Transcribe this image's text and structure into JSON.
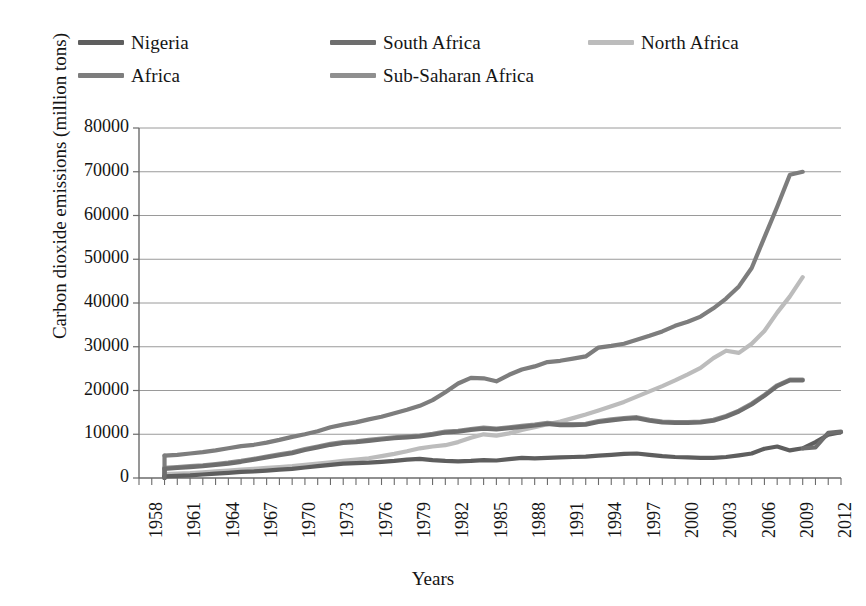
{
  "chart_data": {
    "type": "line",
    "title": "",
    "xlabel": "Years",
    "ylabel": "Carbon dioxide emissions (million tons)",
    "xlim": [
      1958,
      2013
    ],
    "ylim": [
      0,
      80000
    ],
    "ytick_step": 10000,
    "xtick_step": 3,
    "grid": true,
    "legend_position": "top",
    "ytick_labels": [
      "80000",
      "70000",
      "60000",
      "50000",
      "40000",
      "30000",
      "20000",
      "10000",
      "0"
    ],
    "ytick_values": [
      80000,
      70000,
      60000,
      50000,
      40000,
      30000,
      20000,
      10000,
      0
    ],
    "xtick_labels": [
      "1958",
      "1961",
      "1964",
      "1967",
      "1970",
      "1973",
      "1976",
      "1979",
      "1982",
      "1985",
      "1988",
      "1991",
      "1994",
      "1997",
      "2000",
      "2003",
      "2006",
      "2009",
      "2012"
    ],
    "xtick_values": [
      1958,
      1961,
      1964,
      1967,
      1970,
      1973,
      1976,
      1979,
      1982,
      1985,
      1988,
      1991,
      1994,
      1997,
      2000,
      2003,
      2006,
      2009,
      2012
    ],
    "x": [
      1960,
      1961,
      1962,
      1963,
      1964,
      1965,
      1966,
      1967,
      1968,
      1969,
      1970,
      1971,
      1972,
      1973,
      1974,
      1975,
      1976,
      1977,
      1978,
      1979,
      1980,
      1981,
      1982,
      1983,
      1984,
      1985,
      1986,
      1987,
      1988,
      1989,
      1990,
      1991,
      1992,
      1993,
      1994,
      1995,
      1996,
      1997,
      1998,
      1999,
      2000,
      2001,
      2002,
      2003,
      2004,
      2005,
      2006,
      2007,
      2008,
      2009,
      2010,
      2011,
      2012,
      2013
    ],
    "series": [
      {
        "name": "Africa",
        "color": "#7d7d7d",
        "values": [
          5100,
          5300,
          5600,
          5900,
          6300,
          6800,
          7300,
          7600,
          8100,
          8700,
          9400,
          10000,
          10700,
          11600,
          12200,
          12700,
          13400,
          14000,
          14800,
          15600,
          16500,
          17800,
          19600,
          21600,
          22900,
          22800,
          22100,
          23600,
          24800,
          25500,
          26500,
          26800,
          27300,
          27800,
          29800,
          30200,
          30700,
          31600,
          32500,
          33500,
          34800,
          35700,
          36900,
          38800,
          41000,
          43800,
          48000,
          55000,
          62000,
          69300,
          70000,
          null,
          null,
          null
        ]
      },
      {
        "name": "North Africa",
        "color": "#bcbcbc",
        "values": [
          900,
          1000,
          1100,
          1300,
          1500,
          1700,
          1900,
          2100,
          2300,
          2500,
          2700,
          3000,
          3300,
          3600,
          3900,
          4200,
          4500,
          5000,
          5500,
          6100,
          6800,
          7200,
          7500,
          8200,
          9200,
          10000,
          9700,
          10200,
          11000,
          11600,
          12300,
          12900,
          13700,
          14500,
          15400,
          16400,
          17400,
          18600,
          19800,
          21000,
          22300,
          23700,
          25200,
          27400,
          29100,
          28600,
          30700,
          33600,
          37800,
          41500,
          45900,
          null,
          null,
          null
        ]
      },
      {
        "name": "Sub-Saharan Africa",
        "color": "#8f8f8f",
        "values": [
          2300,
          2500,
          2700,
          2900,
          3200,
          3500,
          3900,
          4400,
          4900,
          5400,
          5900,
          6600,
          7200,
          7800,
          8200,
          8400,
          8700,
          9000,
          9300,
          9500,
          9700,
          10100,
          10600,
          10800,
          11200,
          11500,
          11300,
          11600,
          11900,
          12200,
          12600,
          12300,
          12300,
          12400,
          13000,
          13400,
          13700,
          13900,
          13300,
          12900,
          12800,
          12800,
          12900,
          13300,
          14200,
          15400,
          17000,
          19000,
          21200,
          22500,
          22500,
          null,
          null,
          null
        ]
      },
      {
        "name": "South Africa",
        "color": "#6e6e6e",
        "values": [
          2100,
          2300,
          2500,
          2700,
          3000,
          3300,
          3700,
          4200,
          4700,
          5200,
          5700,
          6400,
          7000,
          7600,
          8000,
          8200,
          8500,
          8800,
          9100,
          9300,
          9500,
          9900,
          10400,
          10600,
          11000,
          11300,
          11100,
          11400,
          11700,
          12000,
          12400,
          12100,
          12100,
          12200,
          12800,
          13200,
          13500,
          13700,
          13100,
          12700,
          12600,
          12600,
          12700,
          13100,
          14000,
          15200,
          16800,
          18800,
          21000,
          22300,
          22300,
          null,
          null,
          null
        ]
      },
      {
        "name": "Nigeria",
        "color": "#5e5e5e",
        "values": [
          400,
          500,
          600,
          800,
          1000,
          1200,
          1400,
          1500,
          1700,
          1900,
          2100,
          2400,
          2700,
          3000,
          3300,
          3400,
          3500,
          3700,
          3900,
          4200,
          4400,
          4100,
          3900,
          3800,
          3900,
          4100,
          4000,
          4300,
          4600,
          4500,
          4600,
          4700,
          4800,
          4900,
          5100,
          5300,
          5500,
          5600,
          5300,
          5000,
          4800,
          4700,
          4600,
          4600,
          4800,
          5200,
          5600,
          6700,
          7200,
          6300,
          6800,
          8200,
          9900,
          10500
        ]
      },
      {
        "name": "South Africa Tail",
        "color": "#6e6e6e",
        "hidden_from_legend": true,
        "values": [
          null,
          null,
          null,
          null,
          null,
          null,
          null,
          null,
          null,
          null,
          null,
          null,
          null,
          null,
          null,
          null,
          null,
          null,
          null,
          null,
          null,
          null,
          null,
          null,
          null,
          null,
          null,
          null,
          null,
          null,
          null,
          null,
          null,
          null,
          null,
          null,
          null,
          null,
          null,
          null,
          null,
          null,
          null,
          null,
          null,
          null,
          null,
          null,
          null,
          null,
          6800,
          7000,
          10300,
          10600
        ]
      }
    ]
  },
  "legend": {
    "items": [
      {
        "label": "Nigeria",
        "color": "#5e5e5e"
      },
      {
        "label": "South Africa",
        "color": "#6e6e6e"
      },
      {
        "label": "North Africa",
        "color": "#bcbcbc"
      },
      {
        "label": "Africa",
        "color": "#7d7d7d"
      },
      {
        "label": "Sub-Saharan Africa",
        "color": "#8f8f8f"
      }
    ]
  },
  "axes": {
    "y_title": "Carbon dioxide emissions (million tons)",
    "x_title": "Years"
  }
}
